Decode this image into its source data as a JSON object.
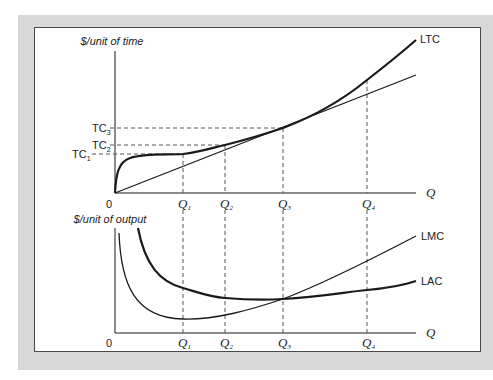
{
  "top_chart": {
    "y_axis_label": "$/unit of time",
    "x_axis_label": "Q",
    "origin_label": "0",
    "y_ticks": [
      {
        "label": "TC",
        "sub": "1"
      },
      {
        "label": "TC",
        "sub": "2"
      },
      {
        "label": "TC",
        "sub": "3"
      }
    ],
    "x_ticks": [
      {
        "label": "Q",
        "sub": "1"
      },
      {
        "label": "Q",
        "sub": "2"
      },
      {
        "label": "Q",
        "sub": "3"
      },
      {
        "label": "Q",
        "sub": "4"
      }
    ],
    "curves": [
      {
        "name": "LTC",
        "label": "LTC"
      },
      {
        "name": "ray",
        "label": ""
      }
    ]
  },
  "bottom_chart": {
    "y_axis_label": "$/unit of output",
    "x_axis_label": "Q",
    "origin_label": "0",
    "x_ticks": [
      {
        "label": "Q",
        "sub": "1"
      },
      {
        "label": "Q",
        "sub": "2"
      },
      {
        "label": "Q",
        "sub": "3"
      },
      {
        "label": "Q",
        "sub": "4"
      }
    ],
    "curves": [
      {
        "name": "LMC",
        "label": "LMC"
      },
      {
        "name": "LAC",
        "label": "LAC"
      }
    ]
  },
  "colors": {
    "frame_grey": "#d8d8d8",
    "line": "#1a1a1a",
    "dashed": "#555555"
  }
}
